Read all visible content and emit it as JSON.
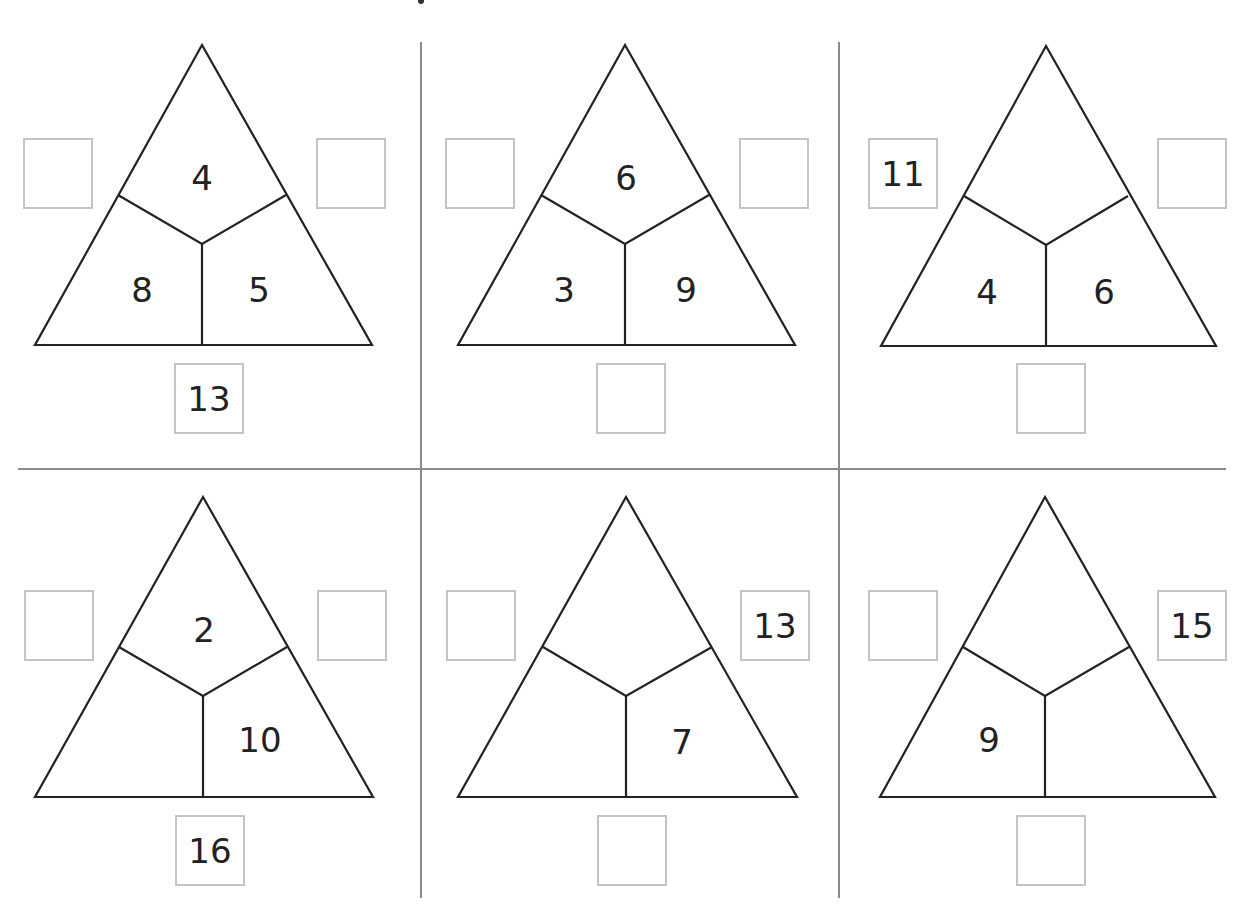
{
  "worksheet": {
    "type": "number-triangle-addition",
    "triangles": [
      {
        "id": 1,
        "top": "4",
        "bottom_left": "8",
        "bottom_right": "5",
        "box_left": "",
        "box_right": "",
        "box_bottom": "13"
      },
      {
        "id": 2,
        "top": "6",
        "bottom_left": "3",
        "bottom_right": "9",
        "box_left": "",
        "box_right": "",
        "box_bottom": ""
      },
      {
        "id": 3,
        "top": "",
        "bottom_left": "4",
        "bottom_right": "6",
        "box_left": "11",
        "box_right": "",
        "box_bottom": ""
      },
      {
        "id": 4,
        "top": "2",
        "bottom_left": "",
        "bottom_right": "10",
        "box_left": "",
        "box_right": "",
        "box_bottom": "16"
      },
      {
        "id": 5,
        "top": "",
        "bottom_left": "",
        "bottom_right": "7",
        "box_left": "",
        "box_right": "13",
        "box_bottom": ""
      },
      {
        "id": 6,
        "top": "",
        "bottom_left": "9",
        "bottom_right": "",
        "box_left": "",
        "box_right": "15",
        "box_bottom": ""
      }
    ]
  },
  "colors": {
    "line": "#222222",
    "box_border": "#c4c4c4",
    "divider": "#8a8a8a",
    "background": "#ffffff"
  }
}
